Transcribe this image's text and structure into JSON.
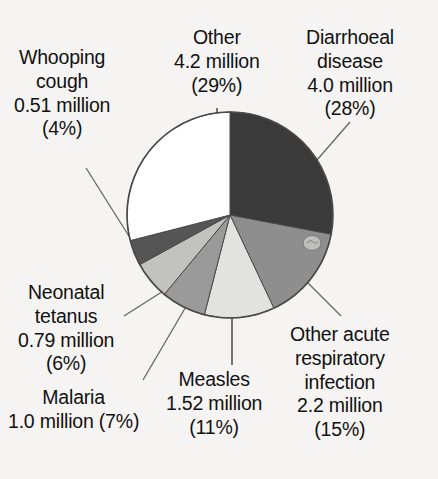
{
  "chart_data": {
    "type": "pie",
    "title": "",
    "subtitle": "",
    "xlabel": "",
    "ylabel": "",
    "legend_position": "none",
    "grid": false,
    "units": "million deaths",
    "start_angle_deg": 0,
    "direction": "clockwise",
    "categories": [
      "Diarrhoeal disease",
      "Other acute respiratory infection",
      "Measles",
      "Malaria",
      "Neonatal tetanus",
      "Whooping cough",
      "Other"
    ],
    "values": [
      4.0,
      2.2,
      1.52,
      1.0,
      0.79,
      0.51,
      4.2
    ],
    "percentages": [
      28,
      15,
      11,
      7,
      6,
      4,
      29
    ],
    "slices": [
      {
        "name": "Diarrhoeal disease",
        "value": 4.0,
        "value_text": "4.0 million",
        "percent": 28,
        "percent_text": "(28%)",
        "color": "#3a3a3a",
        "label_lines": [
          "Diarrhoeal",
          "disease",
          "4.0 million",
          "(28%)"
        ]
      },
      {
        "name": "Other acute respiratory infection",
        "value": 2.2,
        "value_text": "2.2 million",
        "percent": 15,
        "percent_text": "(15%)",
        "color": "#8e8e8e",
        "label_lines": [
          "Other acute",
          "respiratory",
          "infection",
          "2.2 million",
          "(15%)"
        ]
      },
      {
        "name": "Measles",
        "value": 1.52,
        "value_text": "1.52 million",
        "percent": 11,
        "percent_text": "(11%)",
        "color": "#e2e2e0",
        "label_lines": [
          "Measles",
          "1.52 million",
          "(11%)"
        ]
      },
      {
        "name": "Malaria",
        "value": 1.0,
        "value_text": "1.0 million",
        "percent": 7,
        "percent_text": "(7%)",
        "color": "#9a9a9a",
        "label_lines": [
          "Malaria",
          "1.0 million (7%)"
        ]
      },
      {
        "name": "Neonatal tetanus",
        "value": 0.79,
        "value_text": "0.79 million",
        "percent": 6,
        "percent_text": "(6%)",
        "color": "#c2c2c0",
        "label_lines": [
          "Neonatal",
          "tetanus",
          "0.79 million",
          "(6%)"
        ]
      },
      {
        "name": "Whooping cough",
        "value": 0.51,
        "value_text": "0.51 million",
        "percent": 4,
        "percent_text": "(4%)",
        "color": "#555555",
        "label_lines": [
          "Whooping",
          "cough",
          "0.51 million",
          "(4%)"
        ]
      },
      {
        "name": "Other",
        "value": 4.2,
        "value_text": "4.2 million",
        "percent": 29,
        "percent_text": "(29%)",
        "color": "#ffffff",
        "label_lines": [
          "Other",
          "4.2 million",
          "(29%)"
        ]
      }
    ],
    "background_color": "#f6f4f3",
    "outline_color": "#4a4a4a"
  },
  "labels": {
    "diarrhoeal": {
      "l1": "Diarrhoeal",
      "l2": "disease",
      "l3": "4.0 million",
      "l4": "(28%)"
    },
    "other": {
      "l1": "Other",
      "l2": "4.2 million",
      "l3": "(29%)"
    },
    "whooping": {
      "l1": "Whooping",
      "l2": "cough",
      "l3": "0.51 million",
      "l4": "(4%)"
    },
    "neonatal": {
      "l1": "Neonatal",
      "l2": "tetanus",
      "l3": "0.79 million",
      "l4": "(6%)"
    },
    "malaria": {
      "l1": "Malaria",
      "l2": "1.0 million (7%)"
    },
    "measles": {
      "l1": "Measles",
      "l2": "1.52 million",
      "l3": "(11%)"
    },
    "oari": {
      "l1": "Other acute",
      "l2": "respiratory",
      "l3": "infection",
      "l4": "2.2 million",
      "l5": "(15%)"
    }
  }
}
